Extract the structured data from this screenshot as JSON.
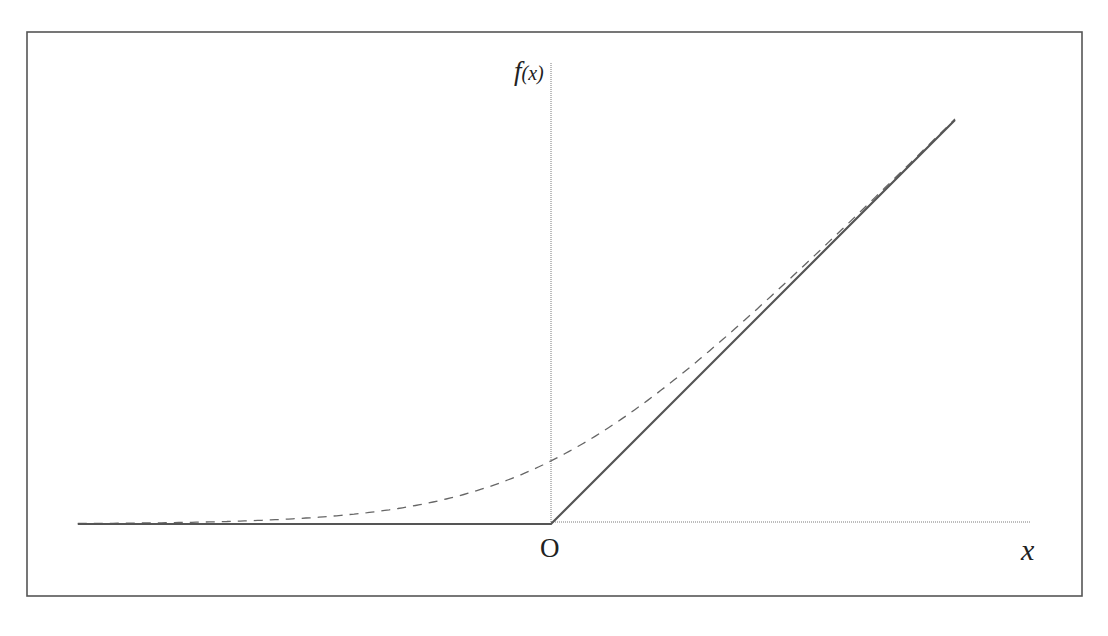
{
  "chart_data": {
    "type": "line",
    "title": "",
    "xlabel": "x",
    "ylabel": "f(x)",
    "origin_label": "O",
    "grid": false,
    "legend": null,
    "xlim": [
      -5.2,
      5.3
    ],
    "ylim": [
      0,
      5.0
    ],
    "series": [
      {
        "name": "ReLU",
        "style": "solid",
        "color": "#555555",
        "x": [
          -5.2,
          0,
          4.44
        ],
        "y": [
          0,
          0,
          4.44
        ]
      },
      {
        "name": "Softplus",
        "style": "dashed",
        "color": "#666666",
        "x": [
          -5.2,
          -4,
          -3,
          -2,
          -1,
          0,
          1,
          2,
          3,
          4,
          4.44
        ],
        "y": [
          0.0055,
          0.018,
          0.049,
          0.127,
          0.313,
          0.693,
          1.313,
          2.127,
          3.049,
          4.018,
          4.45
        ]
      }
    ]
  },
  "labels": {
    "y_axis": "f(x)",
    "y_axis_func": "f",
    "y_axis_arg": "(x)",
    "x_axis": "x",
    "origin": "O"
  },
  "colors": {
    "frame": "#555555",
    "axis": "#7a7a7a",
    "relu": "#555555",
    "softplus": "#666666",
    "background": "#ffffff"
  }
}
